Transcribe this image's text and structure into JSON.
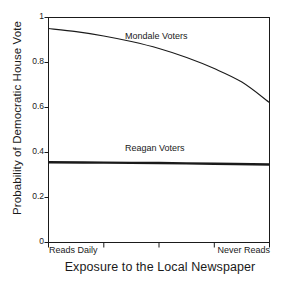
{
  "chart_data": {
    "type": "line",
    "title": "",
    "xlabel": "Exposure to the Local Newspaper",
    "ylabel": "Probability of Democratic House Vote",
    "ylim": [
      0,
      1
    ],
    "yticks": [
      "0",
      "0.2",
      "0.4",
      "0.6",
      "0.8",
      "1"
    ],
    "ytick_values": [
      0,
      0.2,
      0.4,
      0.6,
      0.8,
      1
    ],
    "xlim": [
      0,
      4
    ],
    "xticks": [
      0,
      1,
      2,
      3,
      4
    ],
    "xtick_labels": [
      "Reads Daily",
      "",
      "",
      "",
      "Never Reads"
    ],
    "x_category_left": "Reads Daily",
    "x_category_right": "Never Reads",
    "grid": false,
    "legend_position": "inline-annotation",
    "series": [
      {
        "name": "Mondale Voters",
        "label": "Mondale Voters",
        "x": [
          0,
          0.5,
          1,
          1.5,
          2,
          2.5,
          3,
          3.5,
          4
        ],
        "values": [
          0.951,
          0.937,
          0.918,
          0.893,
          0.862,
          0.822,
          0.773,
          0.713,
          0.622
        ],
        "color": "#1a1a1a",
        "linewidth": 1.1,
        "annotation_x": 2.0,
        "annotation_y": 0.915
      },
      {
        "name": "Reagan Voters",
        "label": "Reagan Voters",
        "x": [
          0,
          1,
          2,
          3,
          4
        ],
        "values": [
          0.357,
          0.355,
          0.353,
          0.35,
          0.347
        ],
        "color": "#1a1a1a",
        "linewidth": 2.4,
        "annotation_x": 2.0,
        "annotation_y": 0.415
      }
    ]
  },
  "axes": {
    "frame_color": "#1a1a1a",
    "background": "#ffffff"
  }
}
